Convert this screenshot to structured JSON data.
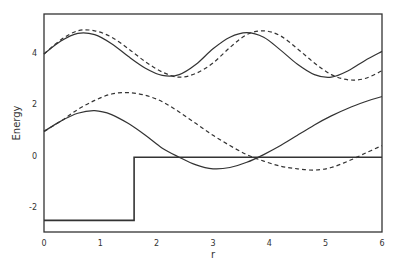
{
  "chart_data": {
    "type": "line",
    "title": "",
    "xlabel": "r",
    "ylabel": "Energy",
    "xlim": [
      0,
      6
    ],
    "ylim": [
      -2.95,
      5.5
    ],
    "xticks": [
      0,
      1,
      2,
      3,
      4,
      5,
      6
    ],
    "yticks": [
      -2,
      0,
      2,
      4
    ],
    "grid": false,
    "legend": null,
    "series": [
      {
        "name": "potential step",
        "style": "solid",
        "x": [
          0,
          1.6,
          1.6,
          6
        ],
        "y": [
          -2.5,
          -2.5,
          -0.05,
          -0.05
        ]
      },
      {
        "name": "upper band (solid)",
        "style": "solid",
        "x": [
          0,
          0.3,
          0.6,
          0.9,
          1.2,
          1.5,
          1.8,
          2.1,
          2.4,
          2.7,
          3.0,
          3.3,
          3.6,
          3.9,
          4.2,
          4.5,
          4.8,
          5.1,
          5.4,
          5.7,
          6.0
        ],
        "y": [
          3.95,
          4.45,
          4.75,
          4.7,
          4.35,
          3.85,
          3.4,
          3.12,
          3.15,
          3.55,
          4.15,
          4.6,
          4.78,
          4.6,
          4.1,
          3.55,
          3.15,
          3.05,
          3.3,
          3.7,
          4.05
        ]
      },
      {
        "name": "upper band (dashed)",
        "style": "dashed",
        "x": [
          0,
          0.3,
          0.6,
          0.9,
          1.2,
          1.5,
          1.8,
          2.1,
          2.4,
          2.7,
          3.0,
          3.3,
          3.6,
          3.9,
          4.2,
          4.5,
          4.8,
          5.1,
          5.4,
          5.7,
          6.0
        ],
        "y": [
          3.95,
          4.5,
          4.85,
          4.85,
          4.6,
          4.15,
          3.65,
          3.25,
          3.05,
          3.2,
          3.6,
          4.2,
          4.7,
          4.85,
          4.65,
          4.15,
          3.6,
          3.15,
          2.95,
          3.0,
          3.3
        ]
      },
      {
        "name": "lower band (solid)",
        "style": "solid",
        "x": [
          0,
          0.3,
          0.6,
          0.9,
          1.2,
          1.5,
          1.8,
          2.1,
          2.4,
          2.7,
          3.0,
          3.3,
          3.6,
          3.9,
          4.2,
          4.5,
          4.8,
          5.1,
          5.4,
          5.7,
          6.0
        ],
        "y": [
          0.95,
          1.35,
          1.65,
          1.75,
          1.6,
          1.25,
          0.8,
          0.3,
          -0.05,
          -0.35,
          -0.5,
          -0.45,
          -0.25,
          0.05,
          0.4,
          0.8,
          1.2,
          1.55,
          1.85,
          2.1,
          2.3
        ]
      },
      {
        "name": "lower band (dashed)",
        "style": "dashed",
        "x": [
          0,
          0.3,
          0.6,
          0.9,
          1.2,
          1.5,
          1.8,
          2.1,
          2.4,
          2.7,
          3.0,
          3.3,
          3.6,
          3.9,
          4.2,
          4.5,
          4.8,
          5.1,
          5.4,
          5.7,
          6.0
        ],
        "y": [
          0.95,
          1.35,
          1.8,
          2.15,
          2.4,
          2.45,
          2.35,
          2.1,
          1.7,
          1.25,
          0.8,
          0.4,
          0.05,
          -0.2,
          -0.4,
          -0.5,
          -0.55,
          -0.45,
          -0.2,
          0.1,
          0.4
        ]
      }
    ]
  }
}
